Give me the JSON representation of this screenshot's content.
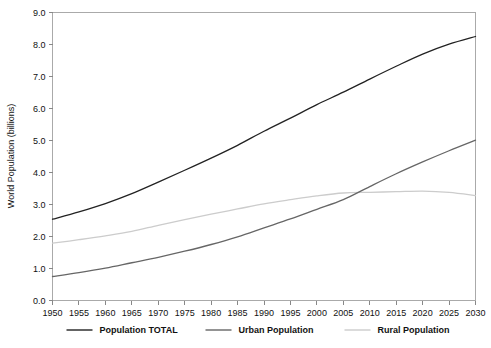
{
  "chart_data": {
    "type": "line",
    "title": "",
    "xlabel": "",
    "ylabel": "World Population (billions)",
    "xlim": [
      1950,
      2030
    ],
    "ylim": [
      0.0,
      9.0
    ],
    "grid": false,
    "legend_position": "bottom",
    "x": [
      1950,
      1955,
      1960,
      1965,
      1970,
      1975,
      1980,
      1985,
      1990,
      1995,
      2000,
      2005,
      2010,
      2015,
      2020,
      2025,
      2030
    ],
    "xtick_labels": [
      "1950",
      "1955",
      "1960",
      "1965",
      "1970",
      "1975",
      "1980",
      "1985",
      "1990",
      "1995",
      "2000",
      "2005",
      "2010",
      "2015",
      "2020",
      "2025",
      "2030"
    ],
    "ytick_labels": [
      "0.0",
      "1.0",
      "2.0",
      "3.0",
      "4.0",
      "5.0",
      "6.0",
      "7.0",
      "8.0",
      "9.0"
    ],
    "ytick_values": [
      0.0,
      1.0,
      2.0,
      3.0,
      4.0,
      5.0,
      6.0,
      7.0,
      8.0,
      9.0
    ],
    "series": [
      {
        "name": "Population TOTAL",
        "color": "#222222",
        "values": [
          2.54,
          2.77,
          3.03,
          3.34,
          3.7,
          4.07,
          4.45,
          4.85,
          5.29,
          5.7,
          6.12,
          6.51,
          6.92,
          7.32,
          7.7,
          8.01,
          8.25
        ]
      },
      {
        "name": "Urban Population",
        "color": "#666666",
        "values": [
          0.75,
          0.87,
          1.01,
          1.18,
          1.35,
          1.54,
          1.75,
          1.99,
          2.27,
          2.55,
          2.85,
          3.15,
          3.56,
          3.96,
          4.33,
          4.68,
          5.01
        ]
      },
      {
        "name": "Rural Population",
        "color": "#cccccc",
        "values": [
          1.79,
          1.9,
          2.02,
          2.16,
          2.35,
          2.53,
          2.7,
          2.86,
          3.02,
          3.15,
          3.27,
          3.36,
          3.38,
          3.4,
          3.42,
          3.38,
          3.28
        ]
      }
    ]
  },
  "legend": {
    "items": [
      {
        "label": "Population TOTAL",
        "color": "#222222"
      },
      {
        "label": "Urban Population",
        "color": "#666666"
      },
      {
        "label": "Rural Population",
        "color": "#cccccc"
      }
    ]
  }
}
